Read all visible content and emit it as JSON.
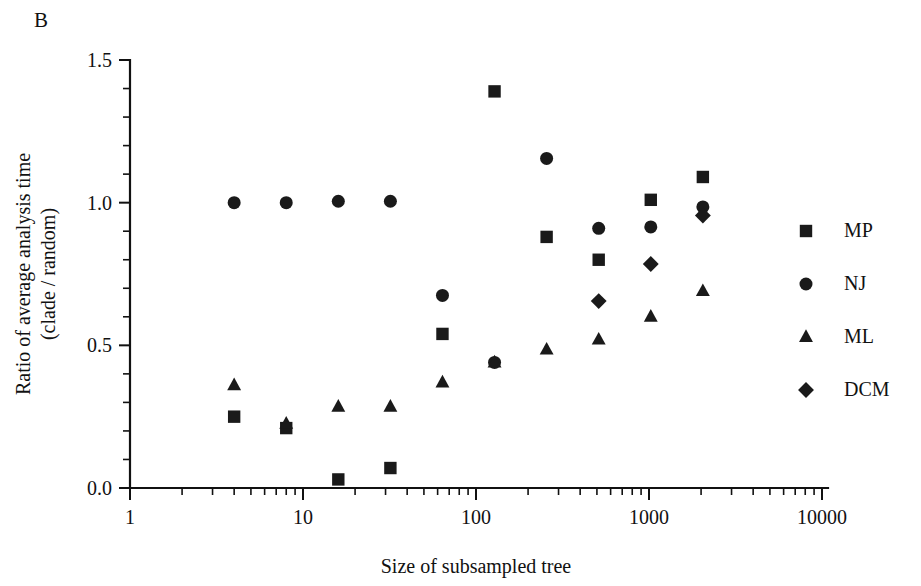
{
  "panel": {
    "label": "B"
  },
  "axes": {
    "x_title": "Size of subsampled tree",
    "y_title_line1": "Ratio of average analysis time",
    "y_title_line2": "(clade / random)",
    "x_ticks": [
      "1",
      "10",
      "100",
      "1000",
      "10000"
    ],
    "y_ticks": [
      "0.0",
      "0.5",
      "1.0",
      "1.5"
    ]
  },
  "legend": {
    "items": [
      {
        "label": "MP",
        "marker": "square-marker"
      },
      {
        "label": "NJ",
        "marker": "circle-marker"
      },
      {
        "label": "ML",
        "marker": "triangle-marker"
      },
      {
        "label": "DCM",
        "marker": "diamond-marker"
      }
    ]
  },
  "colors": {
    "marker": "#1a1a1a",
    "axis": "#111111",
    "background": "#ffffff"
  },
  "chart_data": {
    "type": "scatter",
    "title": "",
    "panel_label": "B",
    "xlabel": "Size of subsampled tree",
    "ylabel": "Ratio of average analysis time (clade / random)",
    "xscale": "log",
    "xlim": [
      1,
      10000
    ],
    "ylim": [
      0.0,
      1.5
    ],
    "xticks": [
      1,
      10,
      100,
      1000,
      10000
    ],
    "yticks": [
      0.0,
      0.5,
      1.0,
      1.5
    ],
    "grid": false,
    "legend_position": "right",
    "series": [
      {
        "name": "MP",
        "marker": "square",
        "x": [
          4,
          8,
          16,
          32,
          64,
          128,
          256,
          512,
          1024,
          2048
        ],
        "y": [
          0.25,
          0.21,
          0.03,
          0.07,
          0.54,
          1.39,
          0.88,
          0.8,
          1.01,
          1.09
        ]
      },
      {
        "name": "NJ",
        "marker": "circle",
        "x": [
          4,
          8,
          16,
          32,
          64,
          128,
          256,
          512,
          1024,
          2048
        ],
        "y": [
          1.0,
          1.0,
          1.005,
          1.005,
          0.675,
          0.44,
          1.155,
          0.91,
          0.915,
          0.985
        ]
      },
      {
        "name": "ML",
        "marker": "triangle",
        "x": [
          4,
          8,
          16,
          32,
          64,
          128,
          256,
          512,
          1024,
          2048
        ],
        "y": [
          0.36,
          0.225,
          0.285,
          0.285,
          0.37,
          0.44,
          0.485,
          0.52,
          0.6,
          0.69
        ]
      },
      {
        "name": "DCM",
        "marker": "diamond",
        "x": [
          512,
          1024,
          2048
        ],
        "y": [
          0.655,
          0.785,
          0.955
        ]
      }
    ]
  }
}
